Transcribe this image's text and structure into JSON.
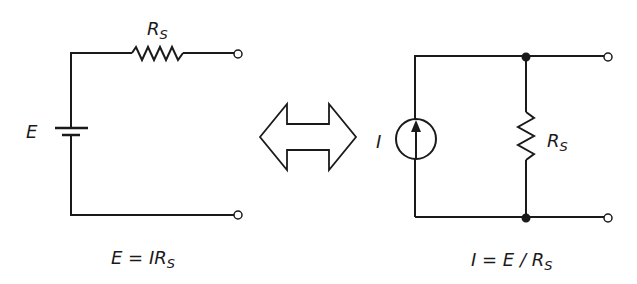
{
  "diagram": {
    "left_circuit": {
      "source_label": "E",
      "resistor_label_main": "R",
      "resistor_label_sub": "S",
      "equation_main": "E = IR",
      "equation_sub": "S"
    },
    "arrow": "double-headed equivalence arrow",
    "right_circuit": {
      "source_label": "I",
      "resistor_label_main": "R",
      "resistor_label_sub": "S",
      "equation_main": "I = E / R",
      "equation_sub": "S"
    },
    "colors": {
      "line": "#1a1a1a",
      "background": "#ffffff"
    }
  }
}
